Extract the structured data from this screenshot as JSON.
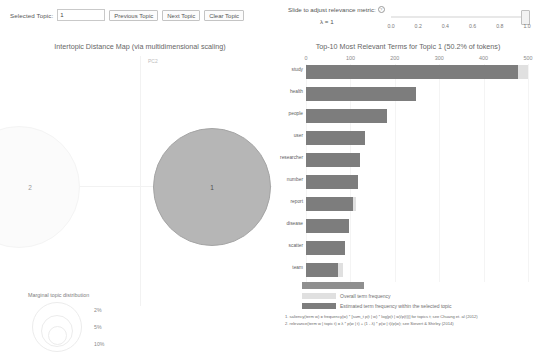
{
  "controls": {
    "selected_topic_label": "Selected Topic:",
    "selected_topic_value": "1",
    "previous_topic": "Previous Topic",
    "next_topic": "Next Topic",
    "clear_topic": "Clear Topic"
  },
  "slider": {
    "title": "Slide to adjust relevance metric:",
    "info_glyph": "?",
    "lambda_text": "λ = 1",
    "ticks": [
      "0.0",
      "0.2",
      "0.4",
      "0.6",
      "0.8",
      "1.0"
    ],
    "value": 1.0
  },
  "left_panel": {
    "title": "Intertopic Distance Map (via multidimensional scaling)",
    "axis_x": "PC1",
    "axis_y": "PC2",
    "bubbles": [
      {
        "id": "1",
        "label": "1"
      },
      {
        "id": "2",
        "label": "2"
      }
    ],
    "marginal": {
      "title": "Marginal topic distribution",
      "sizes": [
        "2%",
        "5%",
        "10%"
      ]
    }
  },
  "legend": {
    "overall": "Overall term frequency",
    "estimated": "Estimated term frequency within the selected topic"
  },
  "footnotes": [
    "1. saliency(term w) = frequency(w) * [sum_t p(t | w) * log(p(t | w)/p(t))] for topics t; see Chuang et. al (2012)",
    "2. relevance(term w | topic t) = λ * p(w | t) + (1 - λ) * p(w | t)/p(w); see Sievert & Shirley (2014)"
  ],
  "chart_data": {
    "type": "bar",
    "title": "Top-10 Most Relevant Terms for Topic 1 (50.2% of tokens)",
    "xlabel": "",
    "ylabel": "",
    "xlim": [
      0,
      500
    ],
    "xticks": [
      0,
      100,
      200,
      300,
      400,
      500
    ],
    "grid": true,
    "orientation": "horizontal",
    "legend_position": "bottom-left",
    "categories": [
      "study",
      "health",
      "people",
      "user",
      "researcher",
      "number",
      "report",
      "disease",
      "scatter",
      "team"
    ],
    "series": [
      {
        "name": "Overall term frequency",
        "values": [
          500,
          248,
          182,
          134,
          122,
          117,
          112,
          97,
          88,
          84
        ]
      },
      {
        "name": "Estimated term frequency within the selected topic",
        "values": [
          477,
          248,
          182,
          134,
          122,
          117,
          105,
          97,
          88,
          73
        ]
      }
    ]
  }
}
